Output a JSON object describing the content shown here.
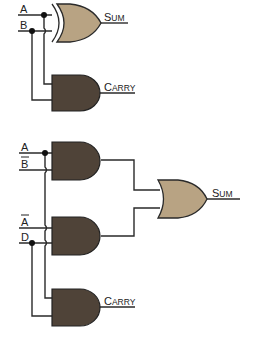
{
  "colors": {
    "xor_or_fill": "#b8a383",
    "and_fill": "#4f4338",
    "wire": "#2a2a2a",
    "label": "#222222"
  },
  "top_circuit": {
    "inputs": [
      {
        "label": "A",
        "overbar": false
      },
      {
        "label": "B",
        "overbar": false
      }
    ],
    "gates": [
      {
        "type": "XOR",
        "output_label_first": "S",
        "output_label_rest": "UM"
      },
      {
        "type": "AND",
        "output_label_first": "C",
        "output_label_rest": "ARRY"
      }
    ]
  },
  "bottom_circuit": {
    "inputs": [
      {
        "label": "A",
        "overbar": false
      },
      {
        "label": "B",
        "overbar": true
      },
      {
        "label": "A",
        "overbar": true
      },
      {
        "label": "D",
        "overbar": false
      }
    ],
    "gates": [
      {
        "type": "AND",
        "name": "and-a-bbar"
      },
      {
        "type": "AND",
        "name": "and-abar-d"
      },
      {
        "type": "OR",
        "output_label_first": "S",
        "output_label_rest": "UM"
      },
      {
        "type": "AND",
        "output_label_first": "C",
        "output_label_rest": "ARRY"
      }
    ]
  }
}
